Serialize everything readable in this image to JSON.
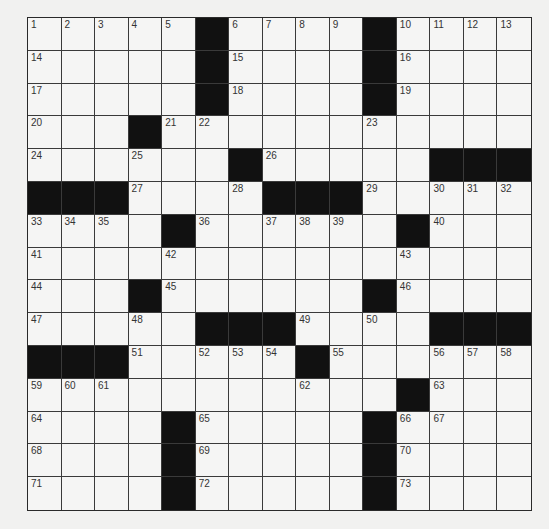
{
  "puzzle": {
    "rows": 15,
    "cols": 15,
    "layout": [
      "1 2 3 4 5 # 6 7 8 9 # 10 11 12 13",
      "14 . . . . # 15 . . . # 16 . . .",
      "17 . . . . # 18 . . . # 19 . . .",
      "20 . . # 21 22 . . . . 23 . . . .",
      "24 . . 25 . . # 26 . . . . # # #",
      "# # # 27 . . 28 # # # 29 . 30 31 32",
      "33 34 35 . # 36 . 37 38 39 . # 40 . .",
      "41 . . . 42 . . . . . . 43 . . .",
      "44 . . # 45 . . . . . # 46 . . .",
      "47 . . 48 . # # # 49 . 50 . # # #",
      "# # # 51 . 52 53 54 # 55 . . 56 57 58",
      "59 60 61 . . . . . 62 . . # 63 . .",
      "64 . . . # 65 . . . . # 66 67 . .",
      "68 . . . # 69 . . . . # 70 . . .",
      "71 . . . # 72 . . . . # 73 . . ."
    ],
    "colors": {
      "block": "#111111",
      "cell": "#f5f5f4",
      "line": "#3a3a3a",
      "number": "#333333"
    }
  }
}
